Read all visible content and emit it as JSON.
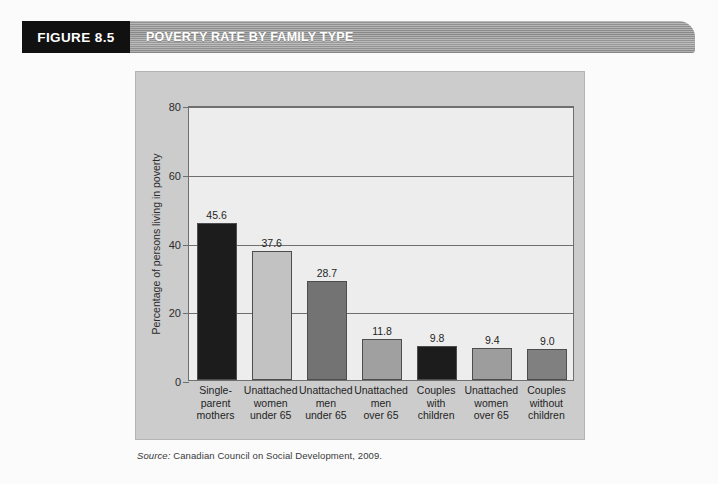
{
  "header": {
    "figure_tag": "FIGURE 8.5",
    "title": "POVERTY RATE BY FAMILY TYPE",
    "tag_bg": "#111111",
    "bar_color": "#909090"
  },
  "source": {
    "label": "Source:",
    "text": "Canadian Council on Social Development, 2009."
  },
  "chart_data": {
    "type": "bar",
    "title": "POVERTY RATE BY FAMILY TYPE",
    "xlabel": "",
    "ylabel": "Percentage of persons living in poverty",
    "ylim": [
      0,
      80
    ],
    "yticks": [
      0,
      20,
      40,
      60,
      80
    ],
    "ytick_labels": [
      "0",
      "20",
      "40",
      "60",
      "80"
    ],
    "grid": true,
    "legend": "none",
    "categories": [
      "Single-parent mothers",
      "Unattached women under 65",
      "Unattached men under 65",
      "Unattached men over 65",
      "Couples with children",
      "Unattached women over 65",
      "Couples without children"
    ],
    "category_lines": [
      [
        "Single-",
        "parent",
        "mothers"
      ],
      [
        "Unattached",
        "women",
        "under 65"
      ],
      [
        "Unattached",
        "men",
        "under 65"
      ],
      [
        "Unattached",
        "men",
        "over 65"
      ],
      [
        "Couples",
        "with",
        "children"
      ],
      [
        "Unattached",
        "women",
        "over 65"
      ],
      [
        "Couples",
        "without",
        "children"
      ]
    ],
    "values": [
      45.6,
      37.6,
      28.7,
      11.8,
      9.8,
      9.4,
      9.0
    ],
    "value_labels": [
      "45.6",
      "37.6",
      "28.7",
      "11.8",
      "9.8",
      "9.4",
      "9.0"
    ],
    "bar_colors": [
      "#1c1c1c",
      "#c2c2c2",
      "#737373",
      "#a0a0a0",
      "#1c1c1c",
      "#9d9d9d",
      "#808080"
    ]
  }
}
